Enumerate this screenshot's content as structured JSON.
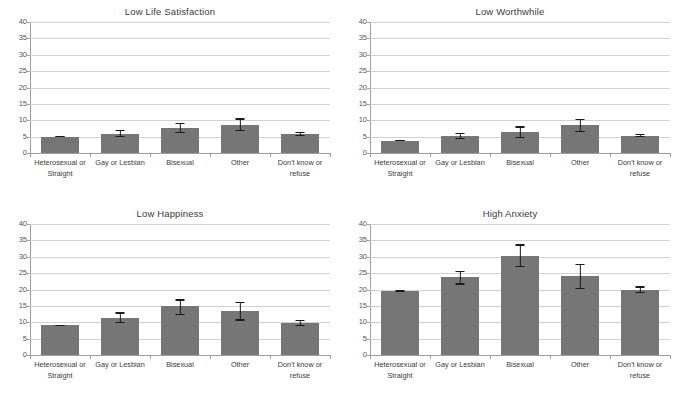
{
  "figure": {
    "categories": [
      "Heterosexual or Straight",
      "Gay or Lesbian",
      "Bisexual",
      "Other",
      "Don't know or refuse"
    ],
    "y_ticks": [
      "0",
      "5",
      "10",
      "15",
      "20",
      "25",
      "30",
      "35",
      "40"
    ],
    "bar_color": "#767676",
    "error_color": "#1a1a1a",
    "gridline_color": "#d2d2d2"
  },
  "chart_data": [
    {
      "type": "bar",
      "title": "Low Life Satisfaction",
      "xlabel": "",
      "ylabel": "",
      "ylim": [
        0,
        40
      ],
      "ytick_step": 5,
      "grid": true,
      "legend": "none",
      "categories": [
        "Heterosexual or Straight",
        "Gay or Lesbian",
        "Bisexual",
        "Other",
        "Don't know or refuse"
      ],
      "values": [
        5.0,
        5.9,
        7.7,
        8.7,
        5.8
      ],
      "error_low": [
        4.8,
        4.9,
        6.1,
        6.7,
        5.1
      ],
      "error_high": [
        5.2,
        7.0,
        9.3,
        10.6,
        6.5
      ]
    },
    {
      "type": "bar",
      "title": "Low Worthwhile",
      "xlabel": "",
      "ylabel": "",
      "ylim": [
        0,
        40
      ],
      "ytick_step": 5,
      "grid": true,
      "legend": "none",
      "categories": [
        "Heterosexual or Straight",
        "Gay or Lesbian",
        "Bisexual",
        "Other",
        "Don't know or refuse"
      ],
      "values": [
        3.8,
        5.1,
        6.3,
        8.6,
        5.3
      ],
      "error_low": [
        3.6,
        4.2,
        4.5,
        6.3,
        4.8
      ],
      "error_high": [
        4.0,
        6.1,
        8.1,
        10.4,
        5.9
      ]
    },
    {
      "type": "bar",
      "title": "Low Happiness",
      "xlabel": "",
      "ylabel": "",
      "ylim": [
        0,
        40
      ],
      "ytick_step": 5,
      "grid": true,
      "legend": "none",
      "categories": [
        "Heterosexual or Straight",
        "Gay or Lesbian",
        "Bisexual",
        "Other",
        "Don't know or refuse"
      ],
      "values": [
        9.1,
        11.4,
        14.9,
        13.4,
        9.7
      ],
      "error_low": [
        8.9,
        9.8,
        12.1,
        10.5,
        8.9
      ],
      "error_high": [
        9.3,
        13.0,
        17.0,
        16.3,
        10.7
      ]
    },
    {
      "type": "bar",
      "title": "High Anxiety",
      "xlabel": "",
      "ylabel": "",
      "ylim": [
        0,
        40
      ],
      "ytick_step": 5,
      "grid": true,
      "legend": "none",
      "categories": [
        "Heterosexual or Straight",
        "Gay or Lesbian",
        "Bisexual",
        "Other",
        "Don't know or refuse"
      ],
      "values": [
        19.5,
        23.7,
        30.3,
        24.1,
        20.0
      ],
      "error_low": [
        19.2,
        21.5,
        26.8,
        20.1,
        18.9
      ],
      "error_high": [
        19.8,
        25.8,
        33.8,
        27.9,
        21.0
      ]
    }
  ]
}
